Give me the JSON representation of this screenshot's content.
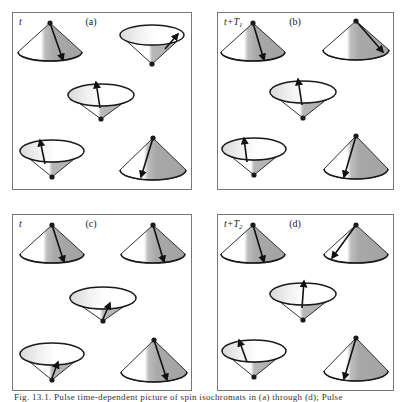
{
  "colors": {
    "frame": "#777777",
    "outline": "#1a1a1a",
    "shade_dark": "#a9a9a9",
    "shade_light": "#e4e4e4",
    "white": "#ffffff",
    "arrow": "#111111"
  },
  "caption": "Fig. 13.1. Pulse time-dependent picture of spin isochromats in (a) through (d); Pulse",
  "panels": [
    {
      "id": "a",
      "letter": "(a)",
      "time_label": "t",
      "time_sub": "",
      "x": 12,
      "y": 12,
      "w": 179,
      "h": 177,
      "cones": [
        {
          "type": "up",
          "cx": 38,
          "apex_y": 11,
          "base_y": 40,
          "rx": 32,
          "ry": 9,
          "arrow_x": 51,
          "arrow_y": 48
        },
        {
          "type": "down",
          "cx": 140,
          "apex_y": 52,
          "base_y": 23,
          "rx": 32,
          "ry": 10,
          "arrow_sx": 153,
          "arrow_sy": 37,
          "arrow_x": 166,
          "arrow_y": 22
        },
        {
          "type": "down",
          "cx": 89,
          "apex_y": 107,
          "base_y": 83,
          "rx": 33,
          "ry": 11,
          "arrow_sx": 88,
          "arrow_sy": 96,
          "arrow_x": 84,
          "arrow_y": 70
        },
        {
          "type": "down",
          "cx": 40,
          "apex_y": 165,
          "base_y": 139,
          "rx": 32,
          "ry": 11,
          "arrow_sx": 33,
          "arrow_sy": 152,
          "arrow_x": 28,
          "arrow_y": 128
        },
        {
          "type": "up",
          "cx": 141,
          "apex_y": 126,
          "base_y": 158,
          "rx": 33,
          "ry": 10,
          "arrow_x": 129,
          "arrow_y": 165
        }
      ]
    },
    {
      "id": "b",
      "letter": "(b)",
      "time_label": "t+T",
      "time_sub": "1",
      "x": 217,
      "y": 12,
      "w": 176,
      "h": 177,
      "cones": [
        {
          "type": "up",
          "cx": 36,
          "apex_y": 11,
          "base_y": 40,
          "rx": 32,
          "ry": 9,
          "arrow_x": 47,
          "arrow_y": 48
        },
        {
          "type": "up",
          "cx": 139,
          "apex_y": 9,
          "base_y": 38,
          "rx": 33,
          "ry": 10,
          "arrow_x": 166,
          "arrow_y": 40
        },
        {
          "type": "down",
          "cx": 86,
          "apex_y": 106,
          "base_y": 80,
          "rx": 33,
          "ry": 11,
          "arrow_sx": 85,
          "arrow_sy": 93,
          "arrow_x": 81,
          "arrow_y": 67
        },
        {
          "type": "down",
          "cx": 37,
          "apex_y": 163,
          "base_y": 137,
          "rx": 32,
          "ry": 11,
          "arrow_sx": 30,
          "arrow_sy": 150,
          "arrow_x": 27,
          "arrow_y": 126
        },
        {
          "type": "up",
          "cx": 139,
          "apex_y": 124,
          "base_y": 157,
          "rx": 32,
          "ry": 10,
          "arrow_x": 127,
          "arrow_y": 165
        }
      ]
    },
    {
      "id": "c",
      "letter": "(c)",
      "time_label": "t",
      "time_sub": "",
      "x": 12,
      "y": 214,
      "w": 179,
      "h": 176,
      "cones": [
        {
          "type": "up",
          "cx": 40,
          "apex_y": 11,
          "base_y": 40,
          "rx": 32,
          "ry": 9,
          "arrow_x": 52,
          "arrow_y": 48
        },
        {
          "type": "up",
          "cx": 141,
          "apex_y": 11,
          "base_y": 40,
          "rx": 32,
          "ry": 9,
          "arrow_x": 152,
          "arrow_y": 48
        },
        {
          "type": "down",
          "cx": 91,
          "apex_y": 107,
          "base_y": 84,
          "rx": 33,
          "ry": 11,
          "arrow_sx": 91,
          "arrow_sy": 105,
          "arrow_x": 98,
          "arrow_y": 89
        },
        {
          "type": "down",
          "cx": 40,
          "apex_y": 166,
          "base_y": 140,
          "rx": 32,
          "ry": 11,
          "arrow_sx": 40,
          "arrow_sy": 164,
          "arrow_x": 46,
          "arrow_y": 148
        },
        {
          "type": "up",
          "cx": 142,
          "apex_y": 126,
          "base_y": 158,
          "rx": 33,
          "ry": 10,
          "arrow_x": 155,
          "arrow_y": 166
        }
      ]
    },
    {
      "id": "d",
      "letter": "(d)",
      "time_label": "t+T",
      "time_sub": "2",
      "x": 217,
      "y": 214,
      "w": 176,
      "h": 176,
      "cones": [
        {
          "type": "up",
          "cx": 36,
          "apex_y": 11,
          "base_y": 40,
          "rx": 32,
          "ry": 9,
          "arrow_x": 47,
          "arrow_y": 48
        },
        {
          "type": "up",
          "cx": 139,
          "apex_y": 11,
          "base_y": 40,
          "rx": 32,
          "ry": 9,
          "arrow_x": 115,
          "arrow_y": 44
        },
        {
          "type": "down",
          "cx": 86,
          "apex_y": 106,
          "base_y": 80,
          "rx": 33,
          "ry": 11,
          "arrow_sx": 85,
          "arrow_sy": 94,
          "arrow_x": 87,
          "arrow_y": 67
        },
        {
          "type": "down",
          "cx": 37,
          "apex_y": 163,
          "base_y": 137,
          "rx": 32,
          "ry": 11,
          "arrow_sx": 30,
          "arrow_sy": 148,
          "arrow_x": 22,
          "arrow_y": 126
        },
        {
          "type": "up",
          "cx": 139,
          "apex_y": 124,
          "base_y": 157,
          "rx": 32,
          "ry": 10,
          "arrow_x": 127,
          "arrow_y": 165
        }
      ]
    }
  ]
}
